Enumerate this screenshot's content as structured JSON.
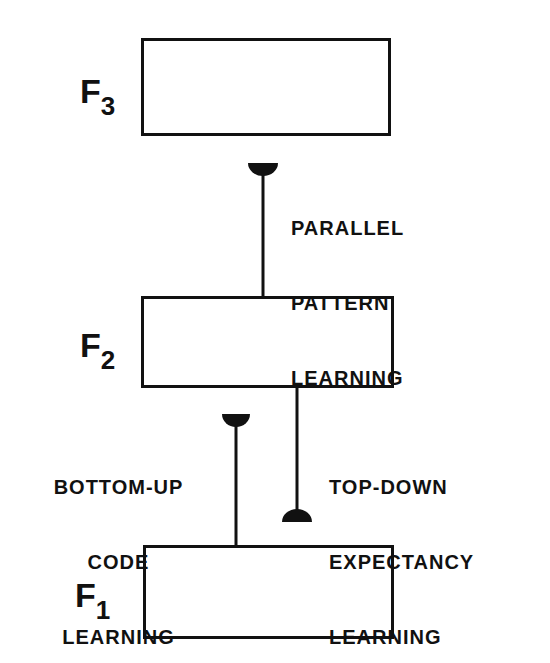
{
  "diagram": {
    "layers": [
      {
        "id": "F3",
        "letter": "F",
        "subscript": "3"
      },
      {
        "id": "F2",
        "letter": "F",
        "subscript": "2"
      },
      {
        "id": "F1",
        "letter": "F",
        "subscript": "1"
      }
    ],
    "connections": [
      {
        "from": "F2",
        "to": "F3",
        "label_lines": [
          "PARALLEL",
          "PATTERN",
          "LEARNING"
        ]
      },
      {
        "from": "F1",
        "to": "F2",
        "label_lines": [
          "BOTTOM-UP",
          "CODE",
          "LEARNING"
        ]
      },
      {
        "from": "F2",
        "to": "F1",
        "label_lines": [
          "TOP-DOWN",
          "EXPECTANCY",
          "LEARNING"
        ]
      }
    ]
  }
}
